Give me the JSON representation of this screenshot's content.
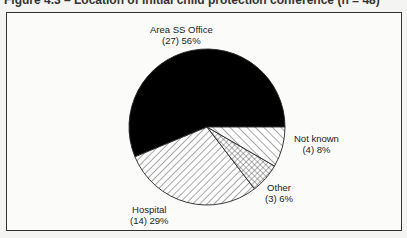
{
  "figure": {
    "title": "Figure 4.3 – Location of initial child protection conference (n = 48)"
  },
  "chart_data": {
    "type": "pie",
    "title": "Figure 4.3 – Location of initial child protection conference (n = 48)",
    "slices": [
      {
        "label": "Area SS Office",
        "count": 27,
        "percent": 56,
        "fill": "solid-black",
        "count_text": "(27) 56%"
      },
      {
        "label": "Hospital",
        "count": 14,
        "percent": 29,
        "fill": "diagonal-hatch",
        "count_text": "(14) 29%"
      },
      {
        "label": "Other",
        "count": 3,
        "percent": 6,
        "fill": "cross-hatch",
        "count_text": "(3) 6%"
      },
      {
        "label": "Not known",
        "count": 4,
        "percent": 8,
        "fill": "back-diagonal-hatch",
        "count_text": "(4) 8%"
      }
    ],
    "legend": "none (direct labels)",
    "start_angle_deg": 0,
    "direction": "counter-clockwise"
  },
  "labels": {
    "area": {
      "name": "Area SS Office",
      "value": "(27) 56%"
    },
    "hospital": {
      "name": "Hospital",
      "value": "(14) 29%"
    },
    "other": {
      "name": "Other",
      "value": "(3) 6%"
    },
    "notknown": {
      "name": "Not known",
      "value": "(4) 8%"
    }
  }
}
